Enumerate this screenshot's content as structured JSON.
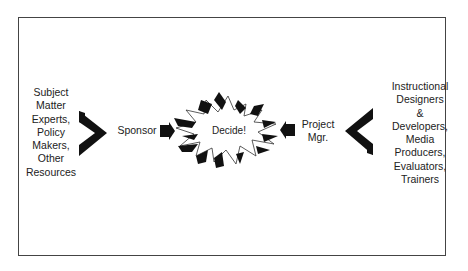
{
  "diagram": {
    "left_group": {
      "lines": [
        "Subject",
        "Matter",
        "Experts,",
        "Policy",
        "Makers,",
        "Other",
        "Resources"
      ],
      "text": "Subject Matter Experts, Policy Makers, Other Resources"
    },
    "sponsor": {
      "text": "Sponsor"
    },
    "center": {
      "text": "Decide!"
    },
    "project_manager": {
      "lines": [
        "Project",
        "Mgr."
      ],
      "text": "Project Mgr."
    },
    "right_group": {
      "lines": [
        "Instructional",
        "Designers",
        "&",
        "Developers,",
        "Media",
        "Producers,",
        "Evaluators,",
        "Trainers"
      ],
      "text": "Instructional Designers & Developers, Media Producers, Evaluators, Trainers"
    },
    "colors": {
      "ink": "#111111",
      "border": "#444444",
      "background": "#ffffff"
    }
  }
}
